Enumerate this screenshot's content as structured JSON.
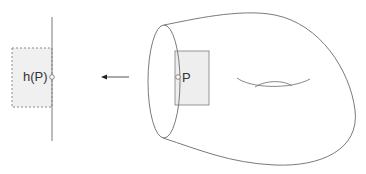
{
  "diagram": {
    "left_panel": {
      "label": "h(P)",
      "description": "boundary line with dashed shaded half-square region and point h(P)"
    },
    "arrow": {
      "direction": "left",
      "meaning": "map h"
    },
    "right_panel": {
      "label": "P",
      "description": "surface with one boundary circle and a handle; shaded square chart at boundary point P"
    },
    "colors": {
      "stroke": "#7a7a7a",
      "shade": "#ececec",
      "dashed": "#8a8a8a",
      "text": "#333333"
    }
  }
}
